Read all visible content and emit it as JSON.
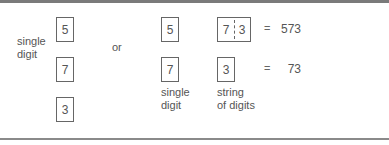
{
  "left_group": {
    "label_line1": "single",
    "label_line2": "digit",
    "boxes": [
      "5",
      "7",
      "3"
    ]
  },
  "separator": "or",
  "middle_group": {
    "boxes": [
      "5",
      "7"
    ],
    "label_line1": "single",
    "label_line2": "digit"
  },
  "right_group": {
    "top_box": {
      "left": "7",
      "right": "3"
    },
    "bottom_box": "3",
    "label_line1": "string",
    "label_line2": "of digits",
    "equals": "=",
    "results": [
      "573",
      "73"
    ]
  },
  "colors": {
    "text": "#555555",
    "box_border": "#666666",
    "rule": "#7a7a7a"
  }
}
